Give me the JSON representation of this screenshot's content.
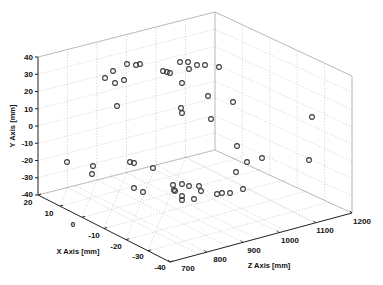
{
  "chart_data": {
    "type": "scatter",
    "projection": "3d",
    "title": "",
    "xlabel": "X Axis [mm]",
    "ylabel": "Y Axis [mm]",
    "zlabel": "Z Axis [mm]",
    "xlim": [
      -40,
      20
    ],
    "ylim": [
      -40,
      40
    ],
    "zlim": [
      700,
      1200
    ],
    "x_ticks": [
      "20",
      "10",
      "0",
      "-10",
      "-20",
      "-30",
      "-40"
    ],
    "y_ticks": [
      "40",
      "30",
      "20",
      "10",
      "0",
      "-10",
      "-20",
      "-30",
      "-40"
    ],
    "z_ticks": [
      "700",
      "800",
      "900",
      "1000",
      "1100",
      "1200"
    ],
    "grid": true,
    "legend": null,
    "marker": "circle-open",
    "marker_color": "#3a3a3a",
    "screen_points": [
      [
        105,
        78
      ],
      [
        113,
        71
      ],
      [
        115,
        83
      ],
      [
        124,
        80
      ],
      [
        117,
        106
      ],
      [
        127,
        64
      ],
      [
        136,
        65
      ],
      [
        140,
        64
      ],
      [
        163,
        71
      ],
      [
        167,
        72
      ],
      [
        170,
        73
      ],
      [
        180,
        62
      ],
      [
        188,
        62
      ],
      [
        189,
        69
      ],
      [
        197,
        65
      ],
      [
        205,
        65
      ],
      [
        219,
        67
      ],
      [
        182,
        83
      ],
      [
        208,
        96
      ],
      [
        233,
        102
      ],
      [
        181,
        108
      ],
      [
        182,
        113
      ],
      [
        211,
        119
      ],
      [
        312,
        117
      ],
      [
        67,
        162
      ],
      [
        93,
        166
      ],
      [
        92,
        174
      ],
      [
        130,
        162
      ],
      [
        134,
        163
      ],
      [
        153,
        168
      ],
      [
        237,
        146
      ],
      [
        247,
        162
      ],
      [
        262,
        158
      ],
      [
        236,
        172
      ],
      [
        309,
        160
      ],
      [
        134,
        188
      ],
      [
        143,
        192
      ],
      [
        173,
        185
      ],
      [
        175,
        191
      ],
      [
        182,
        184
      ],
      [
        189,
        186
      ],
      [
        199,
        186
      ],
      [
        201,
        191
      ],
      [
        174,
        190
      ],
      [
        182,
        196
      ],
      [
        182,
        200
      ],
      [
        194,
        199
      ],
      [
        217,
        194
      ],
      [
        222,
        193
      ],
      [
        230,
        193
      ],
      [
        243,
        189
      ]
    ]
  },
  "labels": {
    "y_axis": "Y Axis [mm]",
    "x_axis": "X Axis [mm]",
    "z_axis": "Z Axis [mm]"
  },
  "ticks": {
    "y": [
      "40",
      "30",
      "20",
      "10",
      "0",
      "-10",
      "-20",
      "-30",
      "-40"
    ],
    "x": [
      "20",
      "10",
      "0",
      "-10",
      "-20",
      "-30",
      "-40"
    ],
    "z": [
      "700",
      "800",
      "900",
      "1000",
      "1100",
      "1200"
    ]
  }
}
